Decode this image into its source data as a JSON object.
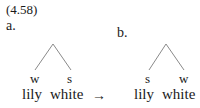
{
  "example_number": "(4.58)",
  "panels": [
    {
      "label": "a.",
      "nodes": [
        "w",
        "s"
      ],
      "words": [
        "lily",
        "white"
      ]
    },
    {
      "label": "b.",
      "nodes": [
        "s",
        "w"
      ],
      "words": [
        "lily",
        "white"
      ]
    }
  ],
  "arrow": "→",
  "colors": {
    "text": "#1a1a1a",
    "lines": "#8a8a8a"
  }
}
